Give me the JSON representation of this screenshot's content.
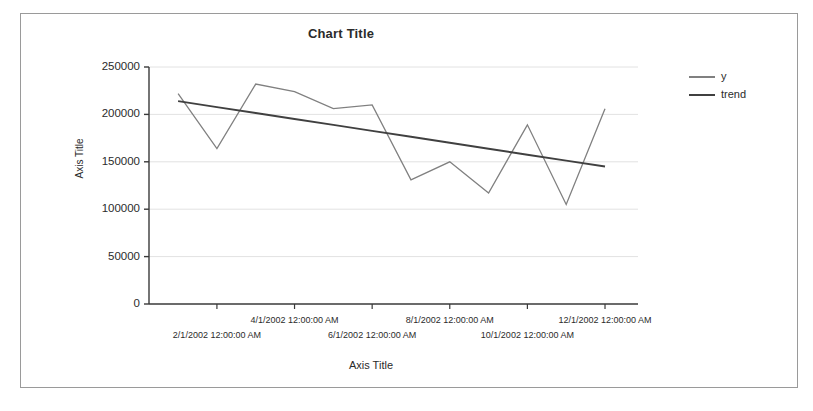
{
  "chart": {
    "title": "Chart Title",
    "y_axis_title": "Axis Title",
    "x_axis_title": "Axis Title"
  },
  "legend": {
    "items": [
      {
        "label": "y",
        "color": "#808080"
      },
      {
        "label": "trend",
        "color": "#404040"
      }
    ]
  },
  "chart_data": {
    "type": "line",
    "title": "Chart Title",
    "xlabel": "Axis Title",
    "ylabel": "Axis Title",
    "grid": true,
    "legend_position": "right",
    "ylim": [
      0,
      250000
    ],
    "yticks": [
      0,
      50000,
      100000,
      150000,
      200000,
      250000
    ],
    "ytick_labels": [
      "0",
      "50000",
      "100000",
      "150000",
      "200000",
      "250000"
    ],
    "xtick_labels": [
      "2/1/2002 12:00:00 AM",
      "4/1/2002 12:00:00 AM",
      "6/1/2002 12:00:00 AM",
      "8/1/2002 12:00:00 AM",
      "10/1/2002 12:00:00 AM",
      "12/1/2002 12:00:00 AM"
    ],
    "x": [
      "1/1/2002",
      "2/1/2002",
      "3/1/2002",
      "4/1/2002",
      "5/1/2002",
      "6/1/2002",
      "7/1/2002",
      "8/1/2002",
      "9/1/2002",
      "10/1/2002",
      "11/1/2002",
      "12/1/2002"
    ],
    "series": [
      {
        "name": "y",
        "color": "#808080",
        "values": [
          222000,
          164000,
          232000,
          224000,
          206000,
          210000,
          131000,
          150000,
          117000,
          189000,
          105000,
          206000
        ]
      },
      {
        "name": "trend",
        "color": "#404040",
        "type": "trendline",
        "values": [
          214000,
          207700,
          201500,
          195200,
          188900,
          182600,
          176400,
          170100,
          163800,
          157500,
          151300,
          145000
        ]
      }
    ]
  }
}
